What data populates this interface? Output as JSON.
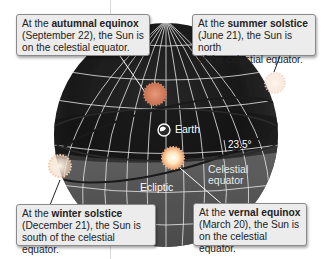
{
  "diagram": {
    "type": "celestial-sphere",
    "callouts": [
      {
        "id": "autumnal",
        "prefix": "At the ",
        "term": "autumnal equinox",
        "line2": "(September 22), the Sun is",
        "line3": "on the celestial equator."
      },
      {
        "id": "summer",
        "prefix": "At the ",
        "term": "summer solstice",
        "line2": "(June 21), the Sun is north",
        "line3": "of the celestial equator."
      },
      {
        "id": "winter",
        "prefix": "At the ",
        "term": "winter solstice",
        "line2": "(December 21), the Sun is",
        "line3": "south of the celestial equator."
      },
      {
        "id": "vernal",
        "prefix": "At the ",
        "term": "vernal equinox",
        "line2": "(March 20), the Sun is",
        "line3": "on the celestial equator."
      }
    ],
    "labels": {
      "earth": "Earth",
      "tilt": "23.5°",
      "celestial_equator_1": "Celestial",
      "celestial_equator_2": "equator",
      "ecliptic": "Ecliptic"
    },
    "colors": {
      "sphere_dark": "#1e1e1e",
      "sphere_mid": "#5a5a5a",
      "grid": "#e6e6e6",
      "callout_bg": "#ececec",
      "callout_border": "#8a8a8a",
      "sun_core": "#fff3d0",
      "sun_ray": "#f0b080"
    }
  }
}
